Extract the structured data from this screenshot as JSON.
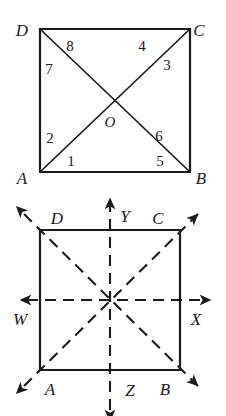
{
  "figure": {
    "stroke_color": "#1a1a1a",
    "background_color": "#ffffff"
  },
  "top_figure": {
    "name": "square-with-diagonals",
    "description": "Square ABCD with both diagonals intersecting at centre O, eight numbered angles",
    "square": {
      "A": {
        "x": 40,
        "y": 172,
        "label": "A"
      },
      "B": {
        "x": 190,
        "y": 172,
        "label": "B"
      },
      "C": {
        "x": 190,
        "y": 29,
        "label": "C"
      },
      "D": {
        "x": 40,
        "y": 29,
        "label": "D"
      }
    },
    "center": {
      "x": 115,
      "y": 101,
      "label": "O"
    },
    "vertex_labels": [
      {
        "text": "D",
        "x": 22,
        "y": 36
      },
      {
        "text": "C",
        "x": 196,
        "y": 36
      },
      {
        "text": "A",
        "x": 22,
        "y": 183
      },
      {
        "text": "B",
        "x": 196,
        "y": 183
      }
    ],
    "angle_numbers": [
      {
        "text": "1",
        "x": 71,
        "y": 166
      },
      {
        "text": "2",
        "x": 50,
        "y": 143
      },
      {
        "text": "3",
        "x": 166,
        "y": 70
      },
      {
        "text": "4",
        "x": 141,
        "y": 51
      },
      {
        "text": "5",
        "x": 160,
        "y": 166
      },
      {
        "text": "6",
        "x": 158,
        "y": 141
      },
      {
        "text": "7",
        "x": 49,
        "y": 73
      },
      {
        "text": "8",
        "x": 70,
        "y": 50
      }
    ]
  },
  "bottom_figure": {
    "name": "square-with-symmetry-axes",
    "description": "Square ABCD with dashed horizontal axis W-X, dashed vertical axis Y-Z and two dashed diagonals, all arrowed beyond the square",
    "square": {
      "A": {
        "x": 40,
        "y": 370,
        "label": "A"
      },
      "B": {
        "x": 180,
        "y": 370,
        "label": "B"
      },
      "C": {
        "x": 180,
        "y": 230,
        "label": "C"
      },
      "D": {
        "x": 40,
        "y": 230,
        "label": "D"
      }
    },
    "center": {
      "x": 110,
      "y": 300
    },
    "vertex_labels": [
      {
        "text": "D",
        "x": 53,
        "y": 222
      },
      {
        "text": "C",
        "x": 157,
        "y": 222
      },
      {
        "text": "A",
        "x": 43,
        "y": 392
      },
      {
        "text": "B",
        "x": 160,
        "y": 392
      }
    ],
    "axis_labels": [
      {
        "text": "W",
        "x": 13,
        "y": 322
      },
      {
        "text": "X",
        "x": 196,
        "y": 322
      },
      {
        "text": "Y",
        "x": 120,
        "y": 219
      },
      {
        "text": "Z",
        "x": 131,
        "y": 394
      }
    ],
    "axes": [
      {
        "name": "horizontal",
        "from": "W",
        "to": "X",
        "style": "dashed",
        "arrows": "both"
      },
      {
        "name": "vertical",
        "from": "Y",
        "to": "Z",
        "style": "dashed",
        "arrows": "both"
      },
      {
        "name": "diagonal-AC",
        "from": "A",
        "to": "C",
        "style": "dashed",
        "arrows": "both"
      },
      {
        "name": "diagonal-DB",
        "from": "D",
        "to": "B",
        "style": "dashed",
        "arrows": "both"
      }
    ]
  }
}
